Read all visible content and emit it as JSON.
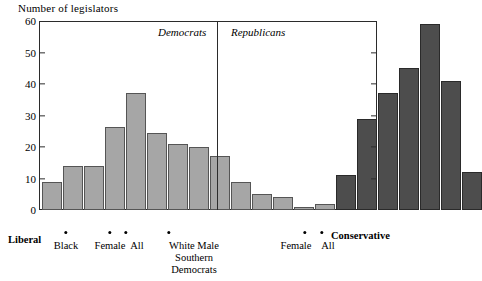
{
  "chart_data": {
    "type": "bar",
    "title": "Number of legislators",
    "xlabel": "",
    "ylabel": "Number of legislators",
    "ylim": [
      0,
      60
    ],
    "ytick_values": [
      0,
      10,
      20,
      30,
      40,
      50,
      60
    ],
    "ytick_labels": [
      "0",
      "10",
      "20",
      "30",
      "40",
      "50",
      "60"
    ],
    "grid": false,
    "legend_position": "none",
    "series": [
      {
        "name": "Democrats",
        "color": "#a6a6a6",
        "values": [
          9,
          14,
          14,
          26.5,
          37,
          24.5,
          21,
          20,
          17,
          9,
          5,
          4,
          1,
          2
        ]
      },
      {
        "name": "Republicans",
        "color": "#4d4d4d",
        "values": [
          11,
          29,
          37,
          45,
          59,
          41,
          12
        ]
      }
    ],
    "annotations": [
      {
        "label": "Democrats",
        "style": "italic"
      },
      {
        "label": "Republicans",
        "style": "italic"
      },
      {
        "label": "Liberal",
        "style": "bold"
      },
      {
        "label": "Conservative",
        "style": "bold"
      },
      {
        "label": "Black"
      },
      {
        "label": "Female"
      },
      {
        "label": "All"
      },
      {
        "label": "White Male"
      },
      {
        "label": "Southern"
      },
      {
        "label": "Democrats"
      },
      {
        "label": "Female"
      },
      {
        "label": "All"
      }
    ]
  },
  "axis": {
    "title": "Number of legislators",
    "yticks": [
      {
        "value": "60",
        "y": 21
      },
      {
        "value": "50",
        "y": 52.5
      },
      {
        "value": "40",
        "y": 84
      },
      {
        "value": "30",
        "y": 115.5
      },
      {
        "value": "20",
        "y": 147
      },
      {
        "value": "10",
        "y": 178.5
      },
      {
        "value": "0",
        "y": 210
      }
    ]
  },
  "parties": {
    "democrats_label": "Democrats",
    "republicans_label": "Republicans"
  },
  "scale": {
    "liberal_label": "Liberal",
    "conservative_label": "Conservative"
  },
  "markers": {
    "dem_black": "Black",
    "dem_female": "Female",
    "dem_all": "All",
    "dem_white_male_1": "White Male",
    "dem_white_male_2": "Southern",
    "dem_white_male_3": "Democrats",
    "rep_female": "Female",
    "rep_all": "All"
  },
  "bars": {
    "democrats": [
      {
        "x": 3,
        "w": 19.5,
        "v": 9
      },
      {
        "x": 24,
        "w": 19.5,
        "v": 14
      },
      {
        "x": 45,
        "w": 19.5,
        "v": 14
      },
      {
        "x": 66,
        "w": 19.5,
        "v": 26.5
      },
      {
        "x": 87,
        "w": 19.5,
        "v": 37
      },
      {
        "x": 108,
        "w": 19.5,
        "v": 24.5
      },
      {
        "x": 129,
        "w": 19.5,
        "v": 21
      },
      {
        "x": 150,
        "w": 19.5,
        "v": 20
      },
      {
        "x": 171,
        "w": 19.5,
        "v": 17
      },
      {
        "x": 192,
        "w": 19.5,
        "v": 9
      },
      {
        "x": 213,
        "w": 19.5,
        "v": 5
      },
      {
        "x": 234,
        "w": 19.5,
        "v": 4
      },
      {
        "x": 255,
        "w": 19.5,
        "v": 1
      },
      {
        "x": 276,
        "w": 19.5,
        "v": 2
      }
    ],
    "republicans": [
      {
        "x": 297,
        "w": 19.5,
        "v": 11
      },
      {
        "x": 318,
        "w": 19.5,
        "v": 29
      },
      {
        "x": 339,
        "w": 19.5,
        "v": 37
      },
      {
        "x": 360,
        "w": 19.5,
        "v": 45
      },
      {
        "x": 381,
        "w": 19.5,
        "v": 59
      },
      {
        "x": 402,
        "w": 19.5,
        "v": 41
      },
      {
        "x": 423,
        "w": 19.5,
        "v": 12
      }
    ]
  },
  "colors": {
    "democrat_fill": "#a6a6a6",
    "republican_fill": "#4d4d4d",
    "axis": "#2b2b2b",
    "background": "#ffffff"
  }
}
